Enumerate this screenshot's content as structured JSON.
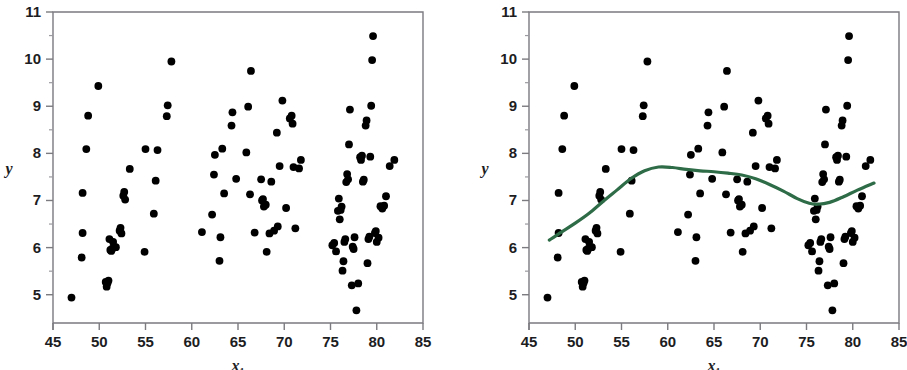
{
  "figure": {
    "background_color": "#ffffff",
    "panel_count": 2
  },
  "panels": [
    {
      "name": "scatterplot-without-smoother",
      "has_smoother": false,
      "x_label": "x",
      "x_label_subscript": "1",
      "y_label": "y"
    },
    {
      "name": "scatterplot-with-smoother",
      "has_smoother": true,
      "x_label": "x",
      "x_label_subscript": "1",
      "y_label": "y"
    }
  ],
  "chart_data": {
    "type": "scatter",
    "title": "",
    "subtitle": "",
    "xlabel": "x1",
    "ylabel": "y",
    "xlim": [
      45,
      85
    ],
    "ylim": [
      4.4,
      11
    ],
    "x_ticks": [
      45,
      50,
      55,
      60,
      65,
      70,
      75,
      80,
      85
    ],
    "x_tick_labels": [
      "45",
      "50",
      "55",
      "60",
      "65",
      "70",
      "75",
      "80",
      "85"
    ],
    "y_ticks": [
      5,
      6,
      7,
      8,
      9,
      10,
      11
    ],
    "y_tick_labels": [
      "5",
      "6",
      "7",
      "8",
      "9",
      "10",
      "11"
    ],
    "y_minor_ticks": [
      5.5,
      6.5,
      7.5,
      8.5,
      9.5,
      10.5
    ],
    "grid": false,
    "legend": "none",
    "marker_color": "#000000",
    "marker_size": 5,
    "points": [
      [
        47.0,
        4.94
      ],
      [
        48.1,
        5.79
      ],
      [
        48.2,
        6.31
      ],
      [
        48.2,
        7.16
      ],
      [
        48.6,
        8.09
      ],
      [
        48.8,
        8.8
      ],
      [
        49.9,
        9.43
      ],
      [
        50.7,
        5.27
      ],
      [
        50.8,
        5.17
      ],
      [
        50.9,
        5.25
      ],
      [
        51.0,
        5.3
      ],
      [
        51.1,
        6.18
      ],
      [
        51.2,
        5.95
      ],
      [
        51.3,
        5.93
      ],
      [
        51.4,
        5.98
      ],
      [
        51.5,
        6.12
      ],
      [
        51.6,
        6.0
      ],
      [
        51.8,
        6.01
      ],
      [
        52.2,
        6.36
      ],
      [
        52.3,
        6.42
      ],
      [
        52.4,
        6.3
      ],
      [
        52.6,
        7.1
      ],
      [
        52.7,
        7.18
      ],
      [
        52.8,
        7.02
      ],
      [
        53.3,
        7.67
      ],
      [
        54.9,
        5.91
      ],
      [
        55.0,
        8.09
      ],
      [
        55.9,
        6.72
      ],
      [
        56.1,
        7.42
      ],
      [
        56.3,
        8.07
      ],
      [
        57.3,
        8.79
      ],
      [
        57.4,
        9.02
      ],
      [
        57.8,
        9.95
      ],
      [
        61.1,
        6.33
      ],
      [
        62.2,
        6.7
      ],
      [
        62.4,
        7.55
      ],
      [
        62.5,
        7.97
      ],
      [
        63.0,
        5.72
      ],
      [
        63.1,
        6.22
      ],
      [
        63.3,
        8.1
      ],
      [
        63.5,
        7.15
      ],
      [
        64.3,
        8.59
      ],
      [
        64.4,
        8.87
      ],
      [
        64.8,
        7.46
      ],
      [
        65.9,
        8.02
      ],
      [
        66.1,
        8.99
      ],
      [
        66.3,
        7.13
      ],
      [
        66.4,
        9.75
      ],
      [
        66.8,
        6.32
      ],
      [
        67.5,
        7.45
      ],
      [
        67.6,
        7.0
      ],
      [
        67.7,
        7.03
      ],
      [
        67.8,
        6.87
      ],
      [
        68.0,
        6.91
      ],
      [
        68.1,
        5.91
      ],
      [
        68.4,
        6.3
      ],
      [
        68.6,
        7.4
      ],
      [
        68.9,
        6.36
      ],
      [
        69.2,
        8.44
      ],
      [
        69.3,
        6.45
      ],
      [
        69.5,
        7.73
      ],
      [
        69.8,
        9.12
      ],
      [
        70.2,
        6.84
      ],
      [
        70.6,
        8.74
      ],
      [
        70.8,
        8.8
      ],
      [
        70.9,
        8.63
      ],
      [
        71.0,
        7.71
      ],
      [
        71.2,
        6.41
      ],
      [
        71.6,
        7.68
      ],
      [
        71.8,
        7.86
      ],
      [
        75.2,
        6.05
      ],
      [
        75.4,
        6.1
      ],
      [
        75.6,
        5.92
      ],
      [
        75.8,
        6.78
      ],
      [
        75.9,
        7.04
      ],
      [
        76.0,
        6.6
      ],
      [
        76.1,
        6.8
      ],
      [
        76.2,
        6.87
      ],
      [
        76.3,
        5.51
      ],
      [
        76.4,
        5.71
      ],
      [
        76.5,
        6.12
      ],
      [
        76.6,
        6.18
      ],
      [
        76.7,
        7.39
      ],
      [
        76.8,
        7.56
      ],
      [
        76.9,
        7.45
      ],
      [
        77.0,
        8.19
      ],
      [
        77.1,
        8.93
      ],
      [
        77.3,
        5.2
      ],
      [
        77.4,
        6.02
      ],
      [
        77.5,
        5.97
      ],
      [
        77.6,
        6.22
      ],
      [
        77.8,
        4.67
      ],
      [
        78.0,
        5.24
      ],
      [
        78.2,
        7.92
      ],
      [
        78.3,
        7.86
      ],
      [
        78.4,
        7.95
      ],
      [
        78.5,
        7.4
      ],
      [
        78.6,
        7.44
      ],
      [
        78.8,
        8.59
      ],
      [
        78.9,
        8.7
      ],
      [
        79.0,
        5.67
      ],
      [
        79.1,
        6.18
      ],
      [
        79.2,
        6.23
      ],
      [
        79.3,
        7.93
      ],
      [
        79.4,
        9.01
      ],
      [
        79.5,
        9.98
      ],
      [
        79.6,
        10.49
      ],
      [
        79.8,
        6.31
      ],
      [
        79.9,
        6.35
      ],
      [
        80.0,
        6.12
      ],
      [
        80.2,
        6.21
      ],
      [
        80.4,
        6.88
      ],
      [
        80.6,
        6.83
      ],
      [
        80.8,
        6.89
      ],
      [
        81.0,
        7.09
      ],
      [
        81.4,
        7.73
      ],
      [
        81.9,
        7.86
      ]
    ],
    "smoother": {
      "name": "lowess-smoother",
      "color": "#2e6b47",
      "line_width": 3.2,
      "x": [
        47.2,
        48.5,
        50.0,
        51.5,
        53.0,
        54.5,
        56.0,
        57.5,
        59.0,
        60.5,
        62.0,
        63.5,
        65.0,
        66.5,
        68.0,
        69.5,
        71.0,
        72.5,
        74.0,
        75.3,
        76.2,
        77.5,
        79.0,
        80.5,
        82.3
      ],
      "y": [
        6.16,
        6.33,
        6.52,
        6.73,
        6.98,
        7.22,
        7.46,
        7.63,
        7.71,
        7.7,
        7.66,
        7.63,
        7.61,
        7.58,
        7.54,
        7.46,
        7.34,
        7.2,
        7.04,
        6.94,
        6.92,
        6.96,
        7.08,
        7.22,
        7.37
      ]
    }
  }
}
